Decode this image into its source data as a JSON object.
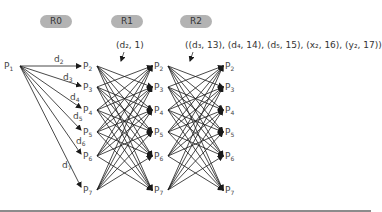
{
  "rounds": [
    {
      "label": "R0",
      "x": 40,
      "y": 15
    },
    {
      "label": "R1",
      "x": 111,
      "y": 15
    },
    {
      "label": "R2",
      "x": 180,
      "y": 15
    }
  ],
  "source_node": {
    "label": "P",
    "sub": "1",
    "x": 4,
    "y": 61
  },
  "columns": [
    {
      "x": 83,
      "nodes": [
        {
          "label": "P",
          "sub": "2",
          "y": 61
        },
        {
          "label": "P",
          "sub": "3",
          "y": 82
        },
        {
          "label": "P",
          "sub": "4",
          "y": 105
        },
        {
          "label": "P",
          "sub": "5",
          "y": 127
        },
        {
          "label": "P",
          "sub": "6",
          "y": 151
        },
        {
          "label": "P",
          "sub": "7",
          "y": 185
        }
      ]
    },
    {
      "x": 154,
      "nodes": [
        {
          "label": "P",
          "sub": "2",
          "y": 61
        },
        {
          "label": "P",
          "sub": "3",
          "y": 82
        },
        {
          "label": "P",
          "sub": "4",
          "y": 105
        },
        {
          "label": "P",
          "sub": "5",
          "y": 127
        },
        {
          "label": "P",
          "sub": "6",
          "y": 151
        },
        {
          "label": "P",
          "sub": "7",
          "y": 185
        }
      ]
    },
    {
      "x": 225,
      "nodes": [
        {
          "label": "P",
          "sub": "2",
          "y": 61
        },
        {
          "label": "P",
          "sub": "3",
          "y": 82
        },
        {
          "label": "P",
          "sub": "4",
          "y": 105
        },
        {
          "label": "P",
          "sub": "5",
          "y": 127
        },
        {
          "label": "P",
          "sub": "6",
          "y": 151
        },
        {
          "label": "P",
          "sub": "7",
          "y": 185
        }
      ]
    }
  ],
  "edge_labels": [
    {
      "label": "d",
      "sub": "2",
      "x": 54,
      "y": 54
    },
    {
      "label": "d",
      "sub": "3",
      "x": 63,
      "y": 72
    },
    {
      "label": "d",
      "sub": "4",
      "x": 70,
      "y": 92
    },
    {
      "label": "d",
      "sub": "5",
      "x": 73,
      "y": 111
    },
    {
      "label": "d",
      "sub": "6",
      "x": 76,
      "y": 136
    },
    {
      "label": "d",
      "sub": "7",
      "x": 62,
      "y": 160
    }
  ],
  "annotations": [
    {
      "id": "r1-note",
      "text": "(d₂, 1)",
      "x": 116,
      "y": 40
    },
    {
      "id": "r2-note",
      "text": "((d₃, 13), (d₄, 14), (d₅, 15), (x₂, 16), (y₂, 17))",
      "x": 185,
      "y": 40
    }
  ],
  "colors": {
    "pill": "#b3b3b3",
    "edge": "#1a1a1a",
    "divider": "#8c8c8c"
  }
}
